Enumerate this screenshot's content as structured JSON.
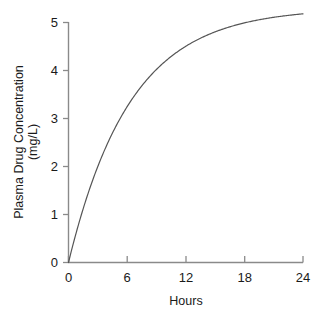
{
  "chart_data": {
    "type": "line",
    "title": "",
    "subtitle": "",
    "xlabel": "Hours",
    "ylabel": "Plasma Drug Concentration\n(mg/L)",
    "ylabel_line1": "Plasma Drug Concentration",
    "ylabel_line2": "(mg/L)",
    "xlim": [
      0,
      24
    ],
    "ylim": [
      0,
      5
    ],
    "xticks": [
      0,
      6,
      12,
      18,
      24
    ],
    "xtick_labels": [
      "0",
      "6",
      "12",
      "18",
      "24"
    ],
    "yticks": [
      0,
      1,
      2,
      3,
      4,
      5
    ],
    "ytick_labels": [
      "0",
      "1",
      "2",
      "3",
      "4",
      "5"
    ],
    "grid": false,
    "legend": false,
    "legend_position": "none",
    "line_color": "#555555",
    "axis_color": "#808080",
    "background_color": "#ffffff",
    "series": [
      {
        "name": "Plasma drug concentration",
        "x": [
          0,
          0.5,
          1,
          1.5,
          2,
          3,
          4,
          5,
          6,
          7,
          8,
          9,
          10,
          11,
          12,
          13,
          14,
          15,
          16,
          17,
          18,
          19,
          20,
          21,
          22,
          23,
          24
        ],
        "values": [
          0,
          0.39,
          0.75,
          1.08,
          1.38,
          1.9,
          2.36,
          2.76,
          3.1,
          3.4,
          3.66,
          3.88,
          4.08,
          4.25,
          4.4,
          4.52,
          4.62,
          4.71,
          4.78,
          4.85,
          4.9,
          4.94,
          4.98,
          5.0,
          5.03,
          5.05,
          5.07
        ]
      }
    ],
    "curve_model": {
      "equation": "C = Cmax * (1 - exp(-k * t))",
      "Cmax": 5.3,
      "k": 0.158
    }
  },
  "axis_labels": {
    "x_title": "Hours",
    "y_title_line1": "Plasma Drug Concentration",
    "y_title_line2": "(mg/L)"
  }
}
